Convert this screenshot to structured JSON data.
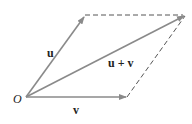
{
  "diagram": {
    "labels": {
      "origin": "O",
      "u": "u",
      "v": "v",
      "sum": "u + v"
    },
    "colors": {
      "vector": "#8a8a8a",
      "dashed": "#555555",
      "text": "#222222"
    },
    "points": {
      "O": [
        26,
        97
      ],
      "u_tip": [
        85,
        15
      ],
      "v_tip": [
        127,
        97
      ],
      "sum_tip": [
        185,
        15
      ]
    }
  }
}
